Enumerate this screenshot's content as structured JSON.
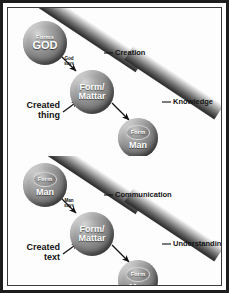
{
  "figure": {
    "colors": {
      "frame": "#1d1d1d",
      "inner_frame": "#3a3a3a",
      "background": "#ffffff",
      "band_light": "#ffffff",
      "band_dark": "#2b2b2b",
      "sphere_light": "#d6d6d6",
      "sphere_dark": "#3f3f3f",
      "text": "#121212",
      "sphere_text": "#ffffff"
    }
  },
  "panels": [
    {
      "id": "creation",
      "name": "divine-creation",
      "spheres": [
        {
          "name": "god",
          "tiny": "Forms",
          "big": "GOD",
          "inner": null
        },
        {
          "name": "form-matter",
          "line1": "Form/",
          "line2": "Mattar",
          "inner": null
        },
        {
          "name": "man",
          "inner": "Form",
          "big": "Man"
        }
      ],
      "arrow_label": {
        "line1": "God",
        "line2": "says"
      },
      "side_label": {
        "line1": "Created",
        "line2": "thing"
      },
      "band_labels": [
        {
          "name": "creation",
          "text": "Creation"
        },
        {
          "name": "knowledge",
          "text": "Knowledge"
        }
      ]
    },
    {
      "id": "communication",
      "name": "human-communication",
      "spheres": [
        {
          "name": "man-source",
          "inner": "Form",
          "big": "Man"
        },
        {
          "name": "form-matter",
          "line1": "Form/",
          "line2": "Mattar",
          "inner": null
        },
        {
          "name": "man-receiver",
          "inner": "Form",
          "big": "Man"
        }
      ],
      "arrow_label": {
        "line1": "Man",
        "line2": "says"
      },
      "side_label": {
        "line1": "Created",
        "line2": "text"
      },
      "band_labels": [
        {
          "name": "communication",
          "text": "Communication"
        },
        {
          "name": "understanding",
          "text": "Understanding"
        }
      ]
    }
  ]
}
